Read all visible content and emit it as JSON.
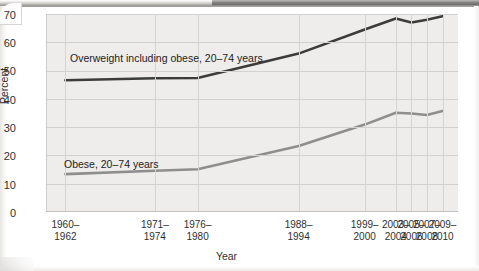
{
  "chart_data": {
    "type": "line",
    "title": "",
    "xlabel": "Year",
    "ylabel": "Percent",
    "ylim": [
      0,
      70
    ],
    "yticks": [
      0,
      10,
      20,
      30,
      40,
      50,
      60,
      70
    ],
    "grid": true,
    "legend_position": "inline-annotation",
    "categories": [
      "1960–1962",
      "1971–1974",
      "1976–1980",
      "1988–1994",
      "1999–2000",
      "2003–2004",
      "2005–2006",
      "2007–2008",
      "2009–2010"
    ],
    "category_years": [
      1961,
      1972.5,
      1978,
      1991,
      1999.5,
      2003.5,
      2005.5,
      2007.5,
      2009.5
    ],
    "xlim": [
      1958.5,
      2011.5
    ],
    "series": [
      {
        "name": "Overweight including obese, 20–74 years",
        "color": "#3c3c3c",
        "values": [
          46.6,
          47.3,
          47.4,
          56.0,
          64.5,
          68.4,
          67.0,
          68.0,
          69.2
        ]
      },
      {
        "name": "Obese, 20–74 years",
        "color": "#8e8e8e",
        "values": [
          13.4,
          14.6,
          15.1,
          23.3,
          30.9,
          35.1,
          34.8,
          34.3,
          35.7
        ]
      }
    ],
    "annotations": [
      {
        "id": "overweight-note",
        "line1": "Overweight including obese,",
        "line2": "20–74 years"
      },
      {
        "id": "obese-note",
        "line1": "Obese, 20–74 years",
        "line2": ""
      }
    ]
  },
  "axis": {
    "y": {
      "label": "Percent",
      "ticks": [
        "70",
        "60",
        "50",
        "40",
        "30",
        "20",
        "10",
        "0"
      ]
    },
    "x": {
      "label": "Year",
      "ticks": [
        {
          "line1": "1960–",
          "line2": "1962"
        },
        {
          "line1": "1971–",
          "line2": "1974"
        },
        {
          "line1": "1976–",
          "line2": "1980"
        },
        {
          "line1": "1988–",
          "line2": "1994"
        },
        {
          "line1": "1999–",
          "line2": "2000"
        },
        {
          "line1": "2003–",
          "line2": "2004"
        },
        {
          "line1": "2005–",
          "line2": "2006"
        },
        {
          "line1": "2007–",
          "line2": "2008"
        },
        {
          "line1": "2009–",
          "line2": "2010"
        }
      ]
    }
  },
  "colors": {
    "overweight_line": "#3c3c3c",
    "obese_line": "#8e8e8e",
    "plot_background": "#eeedeb",
    "gridline": "#d2d1cf",
    "text": "#2f2f2f"
  }
}
